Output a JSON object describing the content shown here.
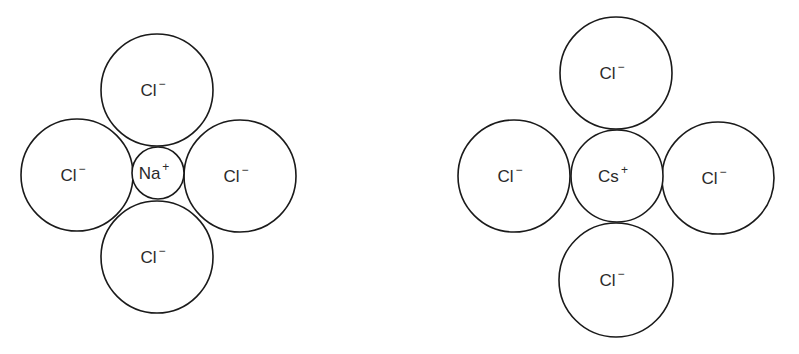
{
  "diagrams": [
    {
      "name": "NaCl",
      "cation": {
        "symbol": "Na",
        "charge": "+",
        "cx": 158,
        "cy": 173,
        "r": 26
      },
      "anions": [
        {
          "symbol": "Cl",
          "charge": "−",
          "position": "top",
          "cx": 157,
          "cy": 90,
          "r": 56
        },
        {
          "symbol": "Cl",
          "charge": "−",
          "position": "left",
          "cx": 77,
          "cy": 175,
          "r": 56
        },
        {
          "symbol": "Cl",
          "charge": "−",
          "position": "right",
          "cx": 240,
          "cy": 176,
          "r": 56
        },
        {
          "symbol": "Cl",
          "charge": "−",
          "position": "bottom",
          "cx": 157,
          "cy": 257,
          "r": 56
        }
      ]
    },
    {
      "name": "CsCl",
      "cation": {
        "symbol": "Cs",
        "charge": "+",
        "cx": 617,
        "cy": 176,
        "r": 46
      },
      "anions": [
        {
          "symbol": "Cl",
          "charge": "−",
          "position": "top",
          "cx": 616,
          "cy": 73,
          "r": 56
        },
        {
          "symbol": "Cl",
          "charge": "−",
          "position": "left",
          "cx": 514,
          "cy": 176,
          "r": 56
        },
        {
          "symbol": "Cl",
          "charge": "−",
          "position": "right",
          "cx": 718,
          "cy": 178,
          "r": 56
        },
        {
          "symbol": "Cl",
          "charge": "−",
          "position": "bottom",
          "cx": 616,
          "cy": 280,
          "r": 57
        }
      ]
    }
  ],
  "colors": {
    "stroke": "#1a1a1a",
    "text": "#2a2a2a",
    "background": "#ffffff"
  }
}
